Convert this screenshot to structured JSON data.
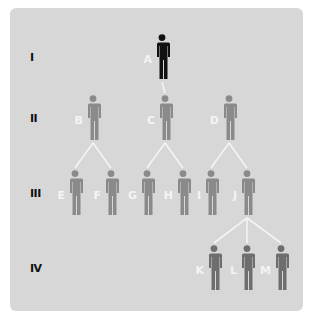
{
  "diagram": {
    "type": "pedigree",
    "colors": {
      "background": "#d7d7d7",
      "line": "#f4f4f4",
      "founder": "#111111",
      "descendant": "#8a8a8a",
      "leaf": "#6e6e6e",
      "person_label": "#f4f4f4",
      "generation_label": "#111111"
    },
    "generations": [
      {
        "label": "I",
        "y": 57
      },
      {
        "label": "II",
        "y": 118
      },
      {
        "label": "III",
        "y": 193
      },
      {
        "label": "IV",
        "y": 268
      }
    ],
    "people": [
      {
        "id": "A",
        "label": "A",
        "generation": 0,
        "x": 162,
        "shade": "founder"
      },
      {
        "id": "B",
        "label": "B",
        "generation": 1,
        "x": 93,
        "shade": "descendant"
      },
      {
        "id": "C",
        "label": "C",
        "generation": 1,
        "x": 165,
        "shade": "descendant"
      },
      {
        "id": "D",
        "label": "D",
        "generation": 1,
        "x": 229,
        "shade": "descendant"
      },
      {
        "id": "E",
        "label": "E",
        "generation": 2,
        "x": 75,
        "shade": "descendant"
      },
      {
        "id": "F",
        "label": "F",
        "generation": 2,
        "x": 111,
        "shade": "descendant"
      },
      {
        "id": "G",
        "label": "G",
        "generation": 2,
        "x": 147,
        "shade": "descendant"
      },
      {
        "id": "H",
        "label": "H",
        "generation": 2,
        "x": 183,
        "shade": "descendant"
      },
      {
        "id": "I",
        "label": "I",
        "generation": 2,
        "x": 211,
        "shade": "descendant"
      },
      {
        "id": "J",
        "label": "J",
        "generation": 2,
        "x": 247,
        "shade": "descendant"
      },
      {
        "id": "K",
        "label": "K",
        "generation": 3,
        "x": 214,
        "shade": "leaf"
      },
      {
        "id": "L",
        "label": "L",
        "generation": 3,
        "x": 247,
        "shade": "leaf"
      },
      {
        "id": "M",
        "label": "M",
        "generation": 3,
        "x": 281,
        "shade": "leaf"
      }
    ],
    "edges": [
      [
        "A",
        "C"
      ],
      [
        "B",
        "E"
      ],
      [
        "B",
        "F"
      ],
      [
        "C",
        "G"
      ],
      [
        "C",
        "H"
      ],
      [
        "D",
        "I"
      ],
      [
        "D",
        "J"
      ],
      [
        "J",
        "K"
      ],
      [
        "J",
        "L"
      ],
      [
        "J",
        "M"
      ]
    ]
  }
}
